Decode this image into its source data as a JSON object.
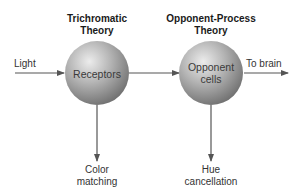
{
  "diagram": {
    "theories": [
      {
        "title_line1": "Trichromatic",
        "title_line2": "Theory"
      },
      {
        "title_line1": "Opponent-Process",
        "title_line2": "Theory"
      }
    ],
    "nodes": [
      {
        "label_line1": "Receptors",
        "label_line2": ""
      },
      {
        "label_line1": "Opponent",
        "label_line2": "cells"
      }
    ],
    "input_label": "Light",
    "output_label": "To brain",
    "outcomes": [
      {
        "line1": "Color",
        "line2": "matching"
      },
      {
        "line1": "Hue",
        "line2": "cancellation"
      }
    ],
    "colors": {
      "sphere_light": "#e6e6e6",
      "sphere_dark": "#6e6e6e",
      "arrow": "#555555"
    }
  }
}
